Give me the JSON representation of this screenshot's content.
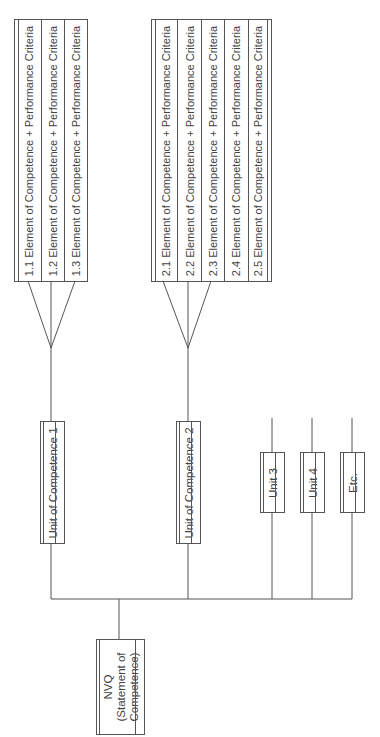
{
  "diagram": {
    "root": {
      "line1": "NVQ",
      "line2": "(Statement of",
      "line3": "Competence)"
    },
    "units": [
      {
        "label": "Unit of Competence 1",
        "elements": [
          "1.1 Element of Competence + Performance Criteria",
          "1.2 Element of Competence + Performance Criteria",
          "1.3 Element of Competence + Performance Criteria"
        ]
      },
      {
        "label": "Unit of Competence 2",
        "elements": [
          "2.1 Element of Competence + Performance Criteria",
          "2.2 Element of Competence + Performance Criteria",
          "2.3 Element of Competence + Performance Criteria",
          "2.4 Element of Competence + Performance Criteria",
          "2.5 Element of Competence + Performance Criteria"
        ]
      },
      {
        "label": "Unit 3"
      },
      {
        "label": "Unit 4"
      },
      {
        "label": "Etc."
      }
    ],
    "colors": {
      "line": "#555555",
      "text": "#444444",
      "background": "#ffffff"
    }
  }
}
